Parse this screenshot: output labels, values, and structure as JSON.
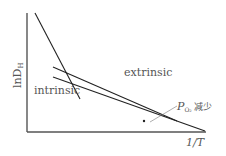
{
  "diagram": {
    "y_axis_label_main": "lnD",
    "y_axis_label_sub": "H",
    "x_axis_label": "1/T",
    "region_labels": {
      "intrinsic": "intrinsic",
      "extrinsic": "extrinsic"
    },
    "annotation": {
      "symbol": "P",
      "subscript": "O₂",
      "text": "减少"
    },
    "colors": {
      "line": "#222222",
      "axis": "#555555",
      "text": "#555555"
    }
  }
}
